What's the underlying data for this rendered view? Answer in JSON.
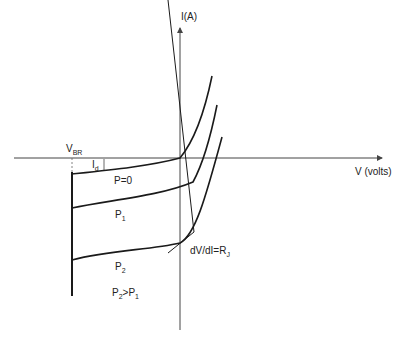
{
  "diagram": {
    "y_axis_label": "I(A)",
    "x_axis_label": "V (volts)",
    "breakdown_label": {
      "main": "V",
      "sub": "BR"
    },
    "dark_current_label": {
      "main": "I",
      "sub": "d"
    },
    "curves": [
      {
        "label_main": "P=0",
        "label_sub": ""
      },
      {
        "label_main": "P",
        "label_sub": "1"
      },
      {
        "label_main": "P",
        "label_sub": "2"
      }
    ],
    "tangent_label": {
      "main": "dV/dI=R",
      "sub": "J"
    },
    "condition_label": {
      "a": "P",
      "a_sub": "2",
      "op": ">P",
      "b_sub": "1"
    },
    "colors": {
      "line": "#1a1a1a",
      "axis": "#444444",
      "background": "#ffffff"
    }
  }
}
